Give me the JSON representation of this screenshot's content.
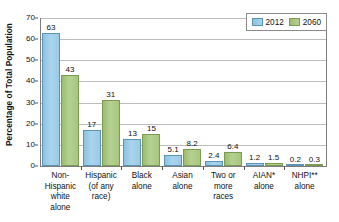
{
  "chart_data": {
    "type": "bar",
    "title": "",
    "xlabel": "",
    "ylabel": "Percentage of Total Population",
    "ylim": [
      0,
      70
    ],
    "yticks": [
      0,
      10,
      20,
      30,
      40,
      50,
      60,
      70
    ],
    "grid": true,
    "legend_position": "top-right",
    "categories": [
      "Non-\nHispanic\nwhite\nalone",
      "Hispanic\n(of any\nrace)",
      "Black\nalone",
      "Asian\nalone",
      "Two or\nmore\nraces",
      "AIAN*\nalone",
      "NHPI**\nalone"
    ],
    "category_lines": [
      [
        "Non-",
        "Hispanic",
        "white",
        "alone"
      ],
      [
        "Hispanic",
        "(of any",
        "race)"
      ],
      [
        "Black",
        "alone"
      ],
      [
        "Asian",
        "alone"
      ],
      [
        "Two or",
        "more",
        "races"
      ],
      [
        "AIAN*",
        "alone"
      ],
      [
        "NHPI**",
        "alone"
      ]
    ],
    "series": [
      {
        "name": "2012",
        "color": "#9ccbe7",
        "values": [
          63,
          17,
          13,
          5.1,
          2.4,
          1.2,
          0.2
        ],
        "labels": [
          "63",
          "17",
          "13",
          "5.1",
          "2.4",
          "1.2",
          "0.2"
        ]
      },
      {
        "name": "2060",
        "color": "#a6c77d",
        "values": [
          43,
          31,
          15,
          8.2,
          6.4,
          1.5,
          0.3
        ],
        "labels": [
          "43",
          "31",
          "15",
          "8.2",
          "6.4",
          "1.5",
          "0.3"
        ]
      }
    ]
  },
  "axis": {
    "y_title": "Percentage of Total Population",
    "y_tick_labels": [
      "70",
      "60",
      "50",
      "40",
      "30",
      "20",
      "10",
      "0"
    ]
  },
  "legend": {
    "items": [
      {
        "label": "2012",
        "color": "#9ccbe7"
      },
      {
        "label": "2060",
        "color": "#a6c77d"
      }
    ]
  }
}
